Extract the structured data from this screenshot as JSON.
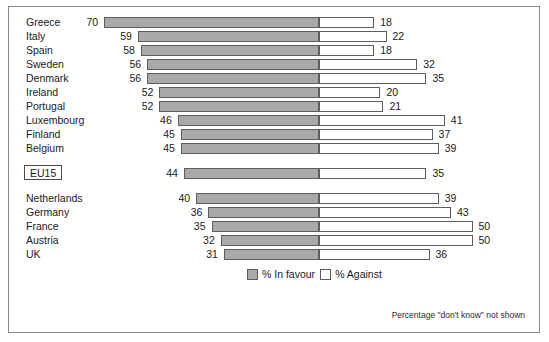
{
  "chart_data": {
    "type": "bar",
    "title": "",
    "subtitle": "",
    "xlabel": "",
    "ylabel": "",
    "orientation": "horizontal",
    "stacked": "diverging",
    "grid": false,
    "axis_zero_label": "",
    "legend_position": "bottom-center",
    "categories": [
      "Greece",
      "Italy",
      "Spain",
      "Sweden",
      "Denmark",
      "Ireland",
      "Portugal",
      "Luxembourg",
      "Finland",
      "Belgium",
      "EU15",
      "Netherlands",
      "Germany",
      "France",
      "Austria",
      "UK"
    ],
    "series": [
      {
        "name": "% In favour",
        "color": "#a9a9a9",
        "direction": "left",
        "values": [
          70,
          59,
          58,
          56,
          56,
          52,
          52,
          46,
          45,
          45,
          44,
          40,
          36,
          35,
          32,
          31
        ]
      },
      {
        "name": "% Against",
        "color": "#ffffff",
        "direction": "right",
        "values": [
          18,
          22,
          18,
          32,
          35,
          20,
          21,
          41,
          37,
          39,
          35,
          39,
          43,
          50,
          50,
          36
        ]
      }
    ],
    "highlighted_category": "EU15",
    "xlim": [
      -70,
      50
    ],
    "footnote": "Percentage \"don't know\" not shown"
  },
  "legend": {
    "items": [
      {
        "label": "% In favour",
        "swatch": "filled-gray-swatch"
      },
      {
        "label": "% Against",
        "swatch": "empty-white-swatch"
      }
    ]
  },
  "footnote": "Percentage \"don't know\" not shown"
}
